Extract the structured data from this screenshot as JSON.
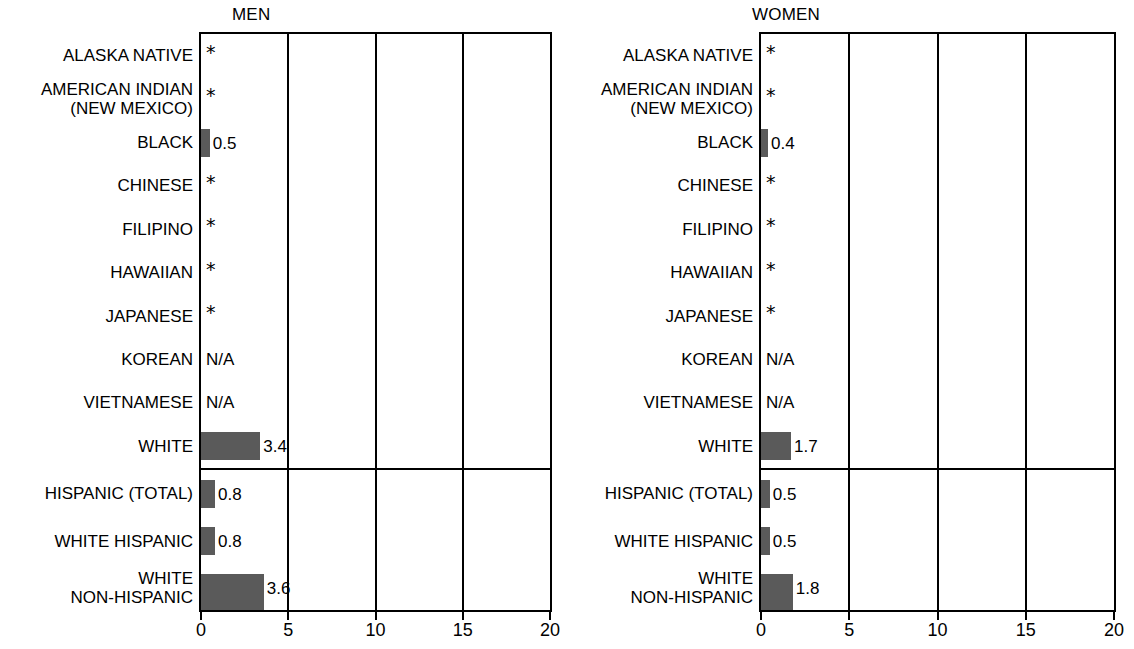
{
  "chart_data": {
    "type": "bar",
    "orientation": "horizontal",
    "title": "",
    "xlabel": "",
    "ylabel": "",
    "xlim": [
      0,
      20
    ],
    "xticks": [
      0,
      5,
      10,
      15,
      20
    ],
    "xtick_labels": [
      "0",
      "5",
      "10",
      "15",
      "20"
    ],
    "grid": true,
    "grid_axis": "x",
    "legend": false,
    "bar_color": "#5a5a5a",
    "panels": [
      {
        "name": "MEN",
        "groups": [
          {
            "categories": [
              "ALASKA NATIVE",
              "AMERICAN INDIAN\n(NEW MEXICO)",
              "BLACK",
              "CHINESE",
              "FILIPINO",
              "HAWAIIAN",
              "JAPANESE",
              "KOREAN",
              "VIETNAMESE",
              "WHITE"
            ],
            "values": [
              null,
              null,
              0.5,
              null,
              null,
              null,
              null,
              null,
              null,
              3.4
            ],
            "markers": [
              "*",
              "*",
              "",
              "*",
              "*",
              "*",
              "*",
              "N/A",
              "N/A",
              ""
            ],
            "value_labels": [
              "",
              "",
              "0.5",
              "",
              "",
              "",
              "",
              "",
              "",
              "3.4"
            ]
          },
          {
            "categories": [
              "HISPANIC (TOTAL)",
              "WHITE HISPANIC",
              "WHITE\nNON-HISPANIC"
            ],
            "values": [
              0.8,
              0.8,
              3.6
            ],
            "markers": [
              "",
              "",
              ""
            ],
            "value_labels": [
              "0.8",
              "0.8",
              "3.6"
            ]
          }
        ]
      },
      {
        "name": "WOMEN",
        "groups": [
          {
            "categories": [
              "ALASKA NATIVE",
              "AMERICAN INDIAN\n(NEW MEXICO)",
              "BLACK",
              "CHINESE",
              "FILIPINO",
              "HAWAIIAN",
              "JAPANESE",
              "KOREAN",
              "VIETNAMESE",
              "WHITE"
            ],
            "values": [
              null,
              null,
              0.4,
              null,
              null,
              null,
              null,
              null,
              null,
              1.7
            ],
            "markers": [
              "*",
              "*",
              "",
              "*",
              "*",
              "*",
              "*",
              "N/A",
              "N/A",
              ""
            ],
            "value_labels": [
              "",
              "",
              "0.4",
              "",
              "",
              "",
              "",
              "",
              "",
              "1.7"
            ]
          },
          {
            "categories": [
              "HISPANIC (TOTAL)",
              "WHITE HISPANIC",
              "WHITE\nNON-HISPANIC"
            ],
            "values": [
              0.5,
              0.5,
              1.8
            ],
            "markers": [
              "",
              "",
              ""
            ],
            "value_labels": [
              "0.5",
              "0.5",
              "1.8"
            ]
          }
        ]
      }
    ]
  },
  "panels": {
    "men": {
      "title": "MEN"
    },
    "women": {
      "title": "WOMEN"
    }
  },
  "axis": {
    "ticks": [
      "0",
      "5",
      "10",
      "15",
      "20"
    ]
  }
}
